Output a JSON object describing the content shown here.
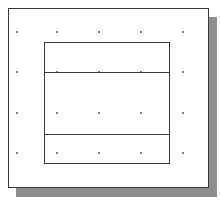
{
  "canvas": {
    "width": 220,
    "height": 202,
    "background": "#ffffff"
  },
  "frame": {
    "x": 8,
    "y": 8,
    "width": 201,
    "height": 180,
    "border_color": "#3a3a3a",
    "shadow_color": "#8e8e8e",
    "shadow_offset": 8
  },
  "grid": {
    "dot_color": "#555555",
    "xs": [
      17,
      57,
      99,
      141,
      183
    ],
    "ys": [
      32,
      72,
      113,
      153
    ]
  },
  "rectangle": {
    "x": 44,
    "y": 42,
    "width": 126,
    "height": 122,
    "stroke": "#3a3a3a",
    "dividers_y": [
      29,
      91
    ]
  }
}
